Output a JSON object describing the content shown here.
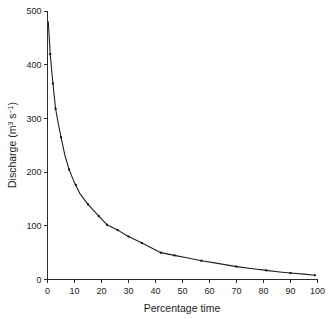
{
  "chart_data": {
    "type": "line",
    "title": "",
    "subtitle": "",
    "xlabel": "Percentage time",
    "ylabel_main": "Discharge (m",
    "ylabel_sup1": "3",
    "ylabel_mid": " s",
    "ylabel_sup2": "−1",
    "ylabel_end": ")",
    "ylabel_plain": "Discharge (m3 s-1)",
    "xlim": [
      0,
      100
    ],
    "ylim": [
      0,
      500
    ],
    "xticks": [
      0,
      10,
      20,
      30,
      40,
      50,
      60,
      70,
      80,
      90,
      100
    ],
    "yticks": [
      0,
      100,
      200,
      300,
      400,
      500
    ],
    "xticklabels": [
      "0",
      "10",
      "20",
      "30",
      "40",
      "50",
      "60",
      "70",
      "80",
      "90",
      "100"
    ],
    "yticklabels": [
      "0",
      "100",
      "200",
      "300",
      "400",
      "500"
    ],
    "grid": false,
    "legend": false,
    "legend_position": "none",
    "series": [
      {
        "name": "Flow duration curve",
        "marker": "point",
        "line_color": "#1e1e1e",
        "x": [
          0.3,
          1.0,
          2.0,
          3.0,
          4.0,
          5.0,
          6.5,
          8.0,
          10.0,
          12.0,
          15.0,
          19.0,
          22.0,
          26.0,
          30.0,
          35.0,
          42.0,
          47.0,
          52.0,
          57.0,
          63.0,
          70.0,
          76.0,
          81.0,
          86.0,
          90.0,
          95.0,
          99.0
        ],
        "y": [
          480,
          420,
          365,
          318,
          290,
          265,
          230,
          205,
          180,
          160,
          140,
          118,
          102,
          92,
          80,
          68,
          50,
          45,
          40,
          35,
          30,
          24,
          20,
          17,
          14,
          12,
          10,
          8
        ]
      }
    ],
    "data_points": [
      {
        "x": 1.0,
        "y": 420
      },
      {
        "x": 2.0,
        "y": 365
      },
      {
        "x": 3.0,
        "y": 318
      },
      {
        "x": 5.0,
        "y": 265
      },
      {
        "x": 8.0,
        "y": 205
      },
      {
        "x": 10.5,
        "y": 176
      },
      {
        "x": 15.0,
        "y": 140
      },
      {
        "x": 19.0,
        "y": 118
      },
      {
        "x": 22.0,
        "y": 102
      },
      {
        "x": 26.0,
        "y": 92
      },
      {
        "x": 30.0,
        "y": 80
      },
      {
        "x": 35.0,
        "y": 68
      },
      {
        "x": 42.0,
        "y": 50
      },
      {
        "x": 47.0,
        "y": 45
      },
      {
        "x": 57.0,
        "y": 35
      },
      {
        "x": 70.0,
        "y": 24
      },
      {
        "x": 81.0,
        "y": 17
      },
      {
        "x": 90.0,
        "y": 12
      },
      {
        "x": 99.0,
        "y": 8
      }
    ]
  },
  "colors": {
    "background": "#ffffff",
    "axis": "#2b2b2b",
    "line": "#1e1e1e",
    "marker": "#111111",
    "text": "#1c1c1c"
  }
}
